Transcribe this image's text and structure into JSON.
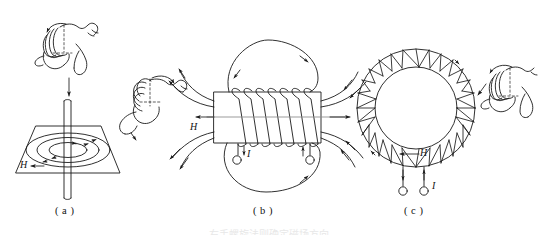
{
  "figure": {
    "kind": "physics-illustration",
    "title_caption": "右手螺旋法则确定磁场方向",
    "ink_color": "#1a1a1a",
    "background": "#ffffff",
    "panels": [
      {
        "id": "a",
        "label": "( a )",
        "subject": "straight-current-wire",
        "field_label": "H",
        "current_label": "",
        "hand": "right-hand-thumb-down",
        "field_lines": 3,
        "description": "Straight vertical conductor piercing a plane; concentric circular magnetic field lines in the plane."
      },
      {
        "id": "b",
        "label": "( b )",
        "subject": "solenoid-coil",
        "field_label": "H",
        "current_label": "I",
        "hand": "right-hand-thumb-left",
        "turns": 7,
        "terminals": 2,
        "description": "Solenoid with rectangular core; field lines loop above and below, axial H to the left."
      },
      {
        "id": "c",
        "label": "( c )",
        "subject": "toroid-coil",
        "field_label": "H",
        "current_label": "I",
        "hand": "right-hand-thumb-down",
        "turns": 28,
        "terminals": 2,
        "description": "Toroidal winding; H circulates inside the ring, leads exit at bottom."
      }
    ]
  }
}
